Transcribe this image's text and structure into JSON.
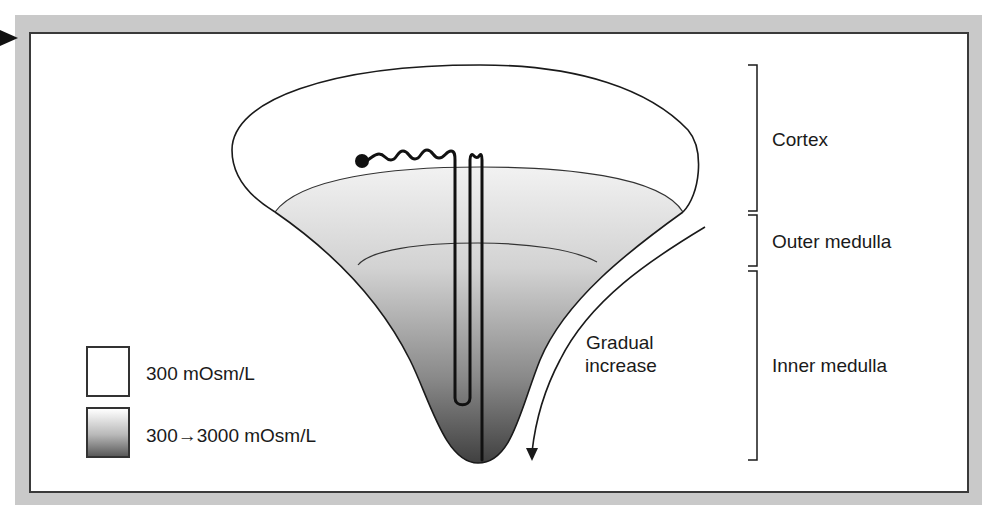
{
  "diagram": {
    "type": "renal-medulla-osmolality-gradient",
    "regions": [
      {
        "id": "cortex",
        "label": "Cortex"
      },
      {
        "id": "outer-medulla",
        "label": "Outer medulla"
      },
      {
        "id": "inner-medulla",
        "label": "Inner medulla"
      }
    ],
    "annotation": {
      "line1": "Gradual",
      "line2": "increase"
    },
    "legend": [
      {
        "swatch": "white",
        "label": "300 mOsm/L"
      },
      {
        "swatch": "gradient",
        "label": "300→3000 mOsm/L"
      }
    ],
    "colors": {
      "frame": "#c9c9c9",
      "stroke": "#1a1a1a",
      "gradient_top": "#f2f2f2",
      "gradient_bottom": "#3c3c3c"
    }
  }
}
